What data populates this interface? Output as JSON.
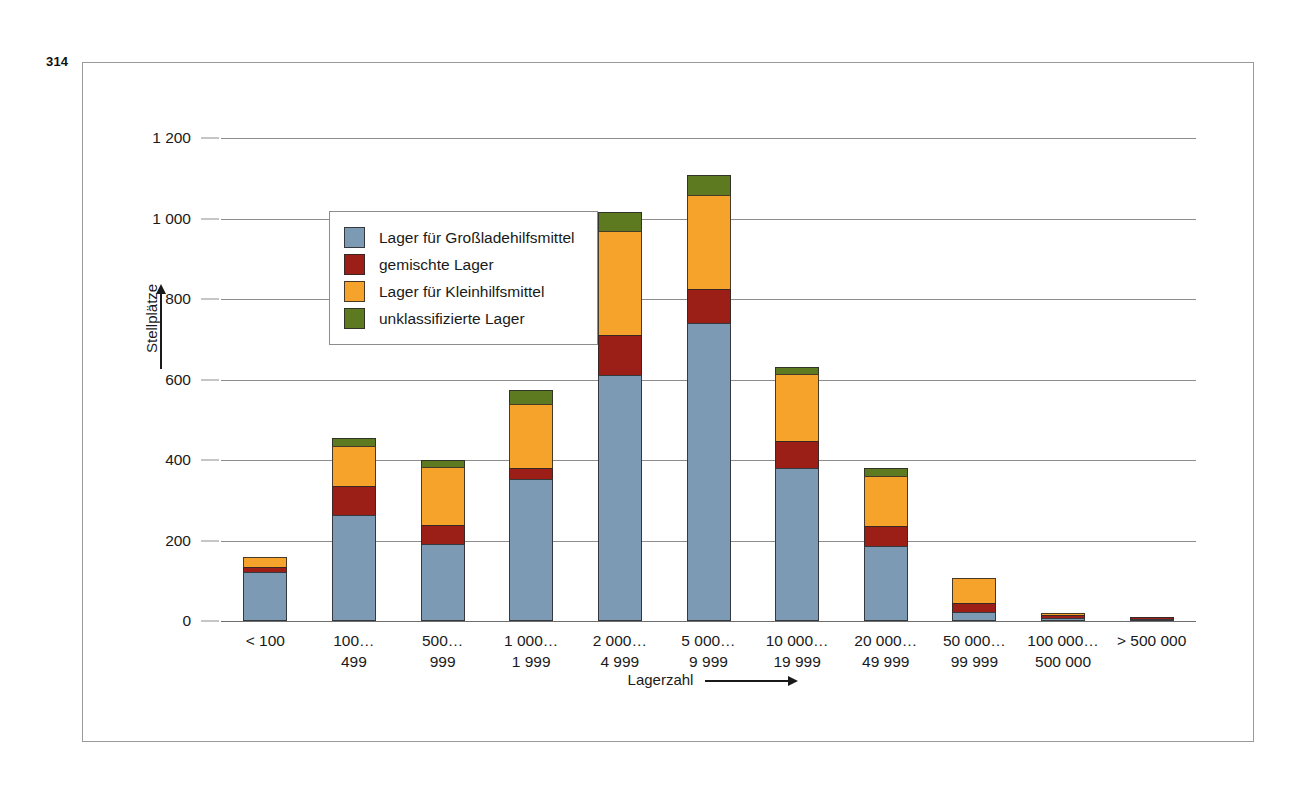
{
  "page": {
    "number": "314"
  },
  "chart_data": {
    "type": "bar",
    "stacked": true,
    "title": "",
    "xlabel": "Lagerzahl",
    "ylabel": "Stellplätze",
    "ylim": [
      0,
      1200
    ],
    "yticks": [
      "0",
      "200",
      "400",
      "600",
      "800",
      "1 000",
      "1 200"
    ],
    "ytick_values": [
      0,
      200,
      400,
      600,
      800,
      1000,
      1200
    ],
    "grid": true,
    "legend_position": "upper-left-inside",
    "categories": [
      [
        "< 100",
        ""
      ],
      [
        "100…",
        "499"
      ],
      [
        "500…",
        "999"
      ],
      [
        "1 000…",
        "1 999"
      ],
      [
        "2 000…",
        "4 999"
      ],
      [
        "5 000…",
        "9 999"
      ],
      [
        "10 000…",
        "19 999"
      ],
      [
        "20 000…",
        "49 999"
      ],
      [
        "50 000…",
        "99 999"
      ],
      [
        "100 000…",
        "500 000"
      ],
      [
        "> 500 000",
        ""
      ]
    ],
    "series": [
      {
        "name": "Lager für Großladehilfsmittel",
        "color": "#7d9ab5",
        "values": [
          122,
          263,
          191,
          352,
          611,
          740,
          380,
          186,
          22,
          8,
          2
        ]
      },
      {
        "name": "gemischte Lager",
        "color": "#9c1f17",
        "values": [
          12,
          72,
          48,
          28,
          100,
          85,
          67,
          50,
          22,
          6,
          1
        ]
      },
      {
        "name": "Lager für Kleinhilfsmittel",
        "color": "#f5a32a",
        "values": [
          26,
          99,
          144,
          159,
          259,
          233,
          166,
          125,
          63,
          6,
          0
        ]
      },
      {
        "name": "unklassifizierte Lager",
        "color": "#5d7a20",
        "values": [
          0,
          22,
          17,
          35,
          46,
          50,
          17,
          20,
          0,
          0,
          0
        ]
      }
    ],
    "totals": [
      160,
      456,
      400,
      574,
      1016,
      1108,
      630,
      381,
      107,
      20,
      3
    ]
  }
}
